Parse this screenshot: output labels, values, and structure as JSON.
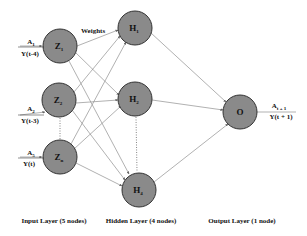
{
  "diagram": {
    "type": "neural-network",
    "title_annotation": "Weights",
    "input_layer": {
      "label": "Input Layer (5 nodes)",
      "nodes": [
        {
          "id": "Z1",
          "base": "Z",
          "sub": "1",
          "input_top": "A",
          "input_top_sub": "1",
          "input_bottom": "Y(t-4)"
        },
        {
          "id": "Z2",
          "base": "Z",
          "sub": "2",
          "input_top": "A",
          "input_top_sub": "2",
          "input_bottom": "Y(t-3)"
        },
        {
          "id": "Zn",
          "base": "Z",
          "sub": "n",
          "input_top": "A",
          "input_top_sub": "5",
          "input_bottom": "Y(t)"
        }
      ]
    },
    "hidden_layer": {
      "label": "Hidden Layer (4 nodes)",
      "nodes": [
        {
          "id": "H1",
          "base": "H",
          "sub": "1"
        },
        {
          "id": "H2",
          "base": "H",
          "sub": "2"
        },
        {
          "id": "H4",
          "base": "H",
          "sub": "4"
        }
      ]
    },
    "output_layer": {
      "label": "Output Layer (1 node)",
      "nodes": [
        {
          "id": "O",
          "base": "O",
          "sub": "",
          "output_top": "A",
          "output_top_sub": "t + 1",
          "output_bottom": "Y(t + 1)"
        }
      ]
    },
    "colors": {
      "node_fill": "#8a8a8a",
      "node_stroke": "#333333",
      "edge": "#8f8f8f",
      "text": "#111111"
    }
  }
}
